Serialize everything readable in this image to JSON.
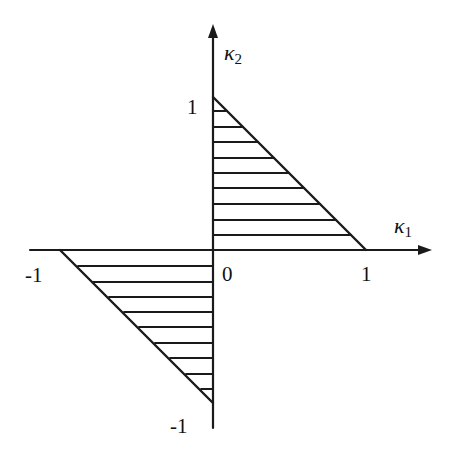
{
  "diagram": {
    "axes": {
      "x_label": "κ",
      "x_label_sub": "1",
      "y_label": "κ",
      "y_label_sub": "2"
    },
    "ticks": {
      "origin": "0",
      "x_pos": "1",
      "x_neg": "-1",
      "y_pos": "1",
      "y_neg": "-1"
    },
    "regions": [
      {
        "name": "upper-right-triangle",
        "vertices": [
          [
            0,
            0
          ],
          [
            1,
            0
          ],
          [
            0,
            1
          ]
        ],
        "hatch": "horizontal"
      },
      {
        "name": "lower-left-triangle",
        "vertices": [
          [
            0,
            0
          ],
          [
            -1,
            0
          ],
          [
            0,
            -1
          ]
        ],
        "hatch": "horizontal"
      }
    ],
    "colors": {
      "ink": "#1a1a1a",
      "background": "#ffffff"
    }
  }
}
